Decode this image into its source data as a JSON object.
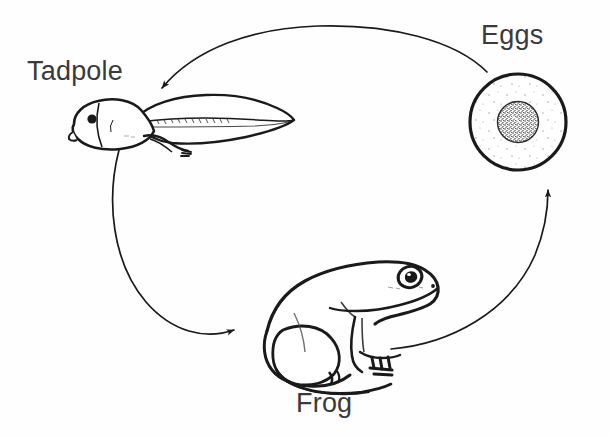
{
  "diagram": {
    "type": "cycle-diagram",
    "background_color": "#fefefe",
    "ink_color": "#1a1a1a",
    "label_color": "#3a3a3a",
    "stages": [
      {
        "id": "eggs",
        "label": "Eggs",
        "icon_name": "frog-egg-illustration",
        "description": "Round egg with stippled dark yolk at centre",
        "position": {
          "x": 518,
          "y": 122
        }
      },
      {
        "id": "tadpole",
        "label": "Tadpole",
        "icon_name": "tadpole-illustration",
        "description": "Tadpole with rounded head, eye, budding hind legs and long finned tail",
        "position": {
          "x": 175,
          "y": 125
        }
      },
      {
        "id": "frog",
        "label": "Frog",
        "icon_name": "frog-illustration",
        "description": "Adult frog in side view, sitting, facing right",
        "position": {
          "x": 355,
          "y": 320
        }
      }
    ],
    "arrows": [
      {
        "id": "eggs-to-tadpole",
        "from": "eggs",
        "to": "tadpole",
        "direction": "left"
      },
      {
        "id": "tadpole-to-frog",
        "from": "tadpole",
        "to": "frog",
        "direction": "down-right"
      },
      {
        "id": "frog-to-eggs",
        "from": "frog",
        "to": "eggs",
        "direction": "up"
      }
    ]
  }
}
